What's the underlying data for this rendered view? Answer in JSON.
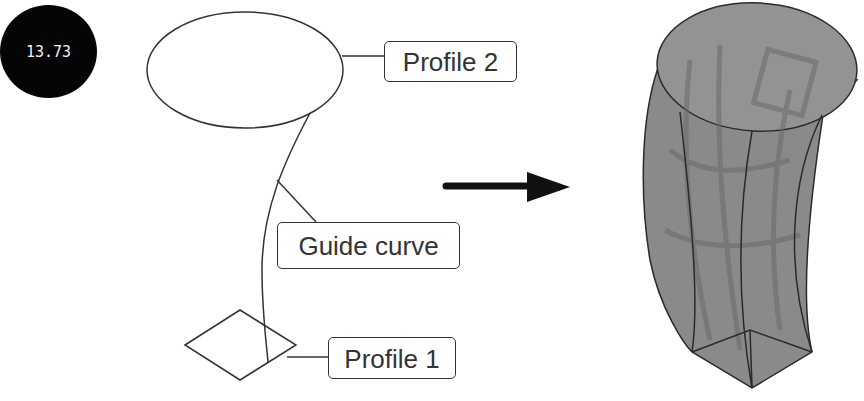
{
  "badge": {
    "value": "13.73"
  },
  "left_sketch": {
    "labels": {
      "profile2": "Profile 2",
      "guide_curve": "Guide curve",
      "profile1": "Profile 1"
    },
    "shapes": {
      "profile2_shape": "ellipse",
      "profile1_shape": "diamond",
      "guide": "curve"
    }
  },
  "arrow": {
    "direction": "right",
    "icon": "arrow-right-icon"
  },
  "result": {
    "description": "swept/lofted solid from diamond to ellipse along guide curve",
    "fill": "#8a8a8a",
    "edge": "#2a2a2a"
  },
  "colors": {
    "line": "#333333",
    "background": "#ffffff",
    "badge": "#050505",
    "arrow": "#111111"
  }
}
